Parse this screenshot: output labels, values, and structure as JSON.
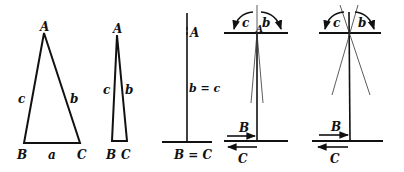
{
  "figures": [
    {
      "id": "fig1",
      "description": "Isosceles triangle ABC",
      "labels": {
        "A": "A",
        "B": "B",
        "C": "C",
        "a": "a",
        "b": "b",
        "c": "c"
      }
    },
    {
      "id": "fig2",
      "description": "Narrow triangle ABC",
      "labels": {
        "A": "A",
        "B": "B",
        "C": "C",
        "b": "b",
        "c": "c"
      }
    },
    {
      "id": "fig3",
      "description": "Degenerate triangle, vertical line on base",
      "labels": {
        "A": "A",
        "bc": "b = c",
        "BC": "B = C"
      }
    },
    {
      "id": "fig4",
      "description": "Vertical rod with narrow cone and rotation arrows",
      "labels": {
        "A": "A",
        "b": "b",
        "c": "c",
        "B": "B",
        "C": "C"
      }
    },
    {
      "id": "fig5",
      "description": "Vertical rod with wide crossing lines and rotation arrows",
      "labels": {
        "b": "b",
        "c": "c",
        "B": "B",
        "C": "C"
      }
    }
  ],
  "colors": {
    "ink": "#111111",
    "background": "#ffffff"
  }
}
